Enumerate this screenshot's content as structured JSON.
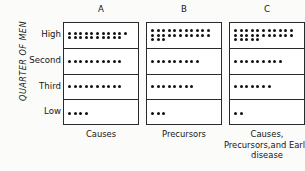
{
  "figure": {
    "y_axis_title": "QUARTER OF MEN",
    "row_labels": [
      "High",
      "Second",
      "Third",
      "Low"
    ],
    "column_headers": [
      "A",
      "B",
      "C"
    ],
    "column_footers": [
      "Causes",
      "Precursors",
      "Causes,\nPrecursors,and\nEarly disease"
    ],
    "colors": {
      "dot": "#111111",
      "border": "#2a2a2a",
      "background": "#fbfbfa",
      "text": "#151515"
    }
  },
  "chart_data": {
    "type": "bar",
    "title": "",
    "subtitle": "",
    "xlabel": "",
    "ylabel": "QUARTER OF MEN",
    "categories": [
      "High",
      "Second",
      "Third",
      "Low"
    ],
    "grid": false,
    "legend_position": "none",
    "dots_per_row_max": 11,
    "series": [
      {
        "name": "A",
        "label": "Causes",
        "values": [
          21,
          10,
          10,
          4
        ],
        "dot_rows": [
          [
            11,
            10
          ],
          [
            10
          ],
          [
            10
          ],
          [
            4
          ]
        ]
      },
      {
        "name": "B",
        "label": "Precursors",
        "values": [
          25,
          9,
          8,
          3
        ],
        "dot_rows": [
          [
            11,
            11,
            3
          ],
          [
            9
          ],
          [
            8
          ],
          [
            3
          ]
        ]
      },
      {
        "name": "C",
        "label": "Causes, Precursors,and Early disease",
        "values": [
          27,
          9,
          7,
          2
        ],
        "dot_rows": [
          [
            11,
            11,
            5
          ],
          [
            9
          ],
          [
            7
          ],
          [
            2
          ]
        ]
      }
    ]
  }
}
